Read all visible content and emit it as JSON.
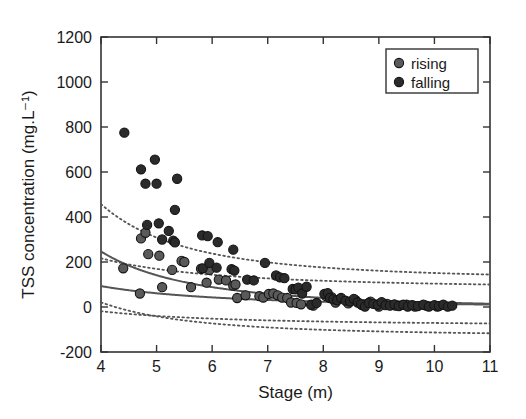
{
  "chart_data": {
    "type": "scatter",
    "title": "",
    "xlabel": "Stage (m)",
    "ylabel": "TSS concentration (mg.L⁻¹)",
    "xlim": [
      4,
      11
    ],
    "ylim": [
      -200,
      1200
    ],
    "xticks": [
      4,
      5,
      6,
      7,
      8,
      9,
      10,
      11
    ],
    "yticks": [
      -200,
      0,
      200,
      400,
      600,
      800,
      1000,
      1200
    ],
    "xticklabels": [
      "4",
      "5",
      "6",
      "7",
      "8",
      "9",
      "10",
      "11"
    ],
    "yticklabels": [
      "-200",
      "0",
      "200",
      "400",
      "600",
      "800",
      "1000",
      "1200"
    ],
    "grid": false,
    "legend": {
      "position": "top-right",
      "entries": [
        {
          "label": "rising",
          "marker": "circle",
          "color": "#5a5a5a"
        },
        {
          "label": "falling",
          "marker": "circle",
          "color": "#2b2b2b"
        }
      ]
    },
    "series": [
      {
        "name": "falling",
        "marker": "circle",
        "color": "#2b2b2b",
        "points": [
          [
            4.42,
            775
          ],
          [
            4.72,
            612
          ],
          [
            4.8,
            548
          ],
          [
            4.97,
            655
          ],
          [
            5.0,
            548
          ],
          [
            5.37,
            570
          ],
          [
            4.83,
            365
          ],
          [
            5.04,
            372
          ],
          [
            5.22,
            338
          ],
          [
            5.3,
            295
          ],
          [
            5.33,
            432
          ],
          [
            5.1,
            300
          ],
          [
            5.33,
            287
          ],
          [
            5.82,
            318
          ],
          [
            5.92,
            315
          ],
          [
            6.1,
            288
          ],
          [
            6.38,
            255
          ],
          [
            5.83,
            172
          ],
          [
            5.95,
            196
          ],
          [
            6.08,
            175
          ],
          [
            6.35,
            168
          ],
          [
            6.4,
            162
          ],
          [
            6.95,
            196
          ],
          [
            6.63,
            122
          ],
          [
            6.75,
            118
          ],
          [
            7.15,
            140
          ],
          [
            7.22,
            132
          ],
          [
            7.3,
            128
          ],
          [
            7.45,
            80
          ],
          [
            7.5,
            78
          ],
          [
            7.55,
            86
          ],
          [
            7.62,
            60
          ],
          [
            7.7,
            90
          ],
          [
            7.78,
            10
          ],
          [
            7.88,
            18
          ],
          [
            8.02,
            58
          ],
          [
            8.08,
            62
          ],
          [
            8.12,
            40
          ],
          [
            8.18,
            34
          ],
          [
            8.25,
            30
          ],
          [
            8.32,
            40
          ],
          [
            8.4,
            28
          ],
          [
            8.48,
            24
          ],
          [
            8.55,
            36
          ],
          [
            8.62,
            20
          ],
          [
            8.68,
            12
          ],
          [
            8.75,
            2
          ],
          [
            8.82,
            18
          ],
          [
            8.9,
            14
          ],
          [
            8.98,
            10
          ],
          [
            9.05,
            22
          ],
          [
            9.12,
            8
          ],
          [
            9.2,
            6
          ],
          [
            9.28,
            12
          ],
          [
            9.36,
            4
          ],
          [
            9.44,
            10
          ],
          [
            9.52,
            2
          ],
          [
            9.6,
            8
          ],
          [
            9.7,
            4
          ],
          [
            9.8,
            10
          ],
          [
            9.9,
            2
          ],
          [
            10.0,
            8
          ],
          [
            10.08,
            4
          ],
          [
            10.16,
            10
          ],
          [
            10.24,
            2
          ],
          [
            10.32,
            6
          ]
        ]
      },
      {
        "name": "rising",
        "marker": "circle",
        "color": "#5a5a5a",
        "points": [
          [
            4.4,
            172
          ],
          [
            4.7,
            60
          ],
          [
            4.72,
            305
          ],
          [
            4.8,
            330
          ],
          [
            4.85,
            235
          ],
          [
            5.05,
            228
          ],
          [
            5.1,
            88
          ],
          [
            5.28,
            165
          ],
          [
            5.45,
            205
          ],
          [
            5.5,
            200
          ],
          [
            5.62,
            88
          ],
          [
            5.8,
            170
          ],
          [
            5.9,
            108
          ],
          [
            5.95,
            165
          ],
          [
            6.12,
            122
          ],
          [
            6.25,
            118
          ],
          [
            6.38,
            95
          ],
          [
            6.42,
            100
          ],
          [
            6.45,
            40
          ],
          [
            6.6,
            52
          ],
          [
            6.85,
            48
          ],
          [
            6.92,
            42
          ],
          [
            7.02,
            58
          ],
          [
            7.1,
            60
          ],
          [
            7.18,
            52
          ],
          [
            7.26,
            42
          ],
          [
            7.35,
            40
          ],
          [
            7.42,
            20
          ],
          [
            7.52,
            18
          ],
          [
            7.6,
            12
          ],
          [
            7.82,
            6
          ],
          [
            8.05,
            48
          ],
          [
            8.15,
            44
          ],
          [
            8.22,
            20
          ],
          [
            8.45,
            16
          ],
          [
            8.58,
            30
          ],
          [
            8.7,
            8
          ],
          [
            8.85,
            24
          ],
          [
            9.0,
            2
          ],
          [
            9.15,
            14
          ],
          [
            9.3,
            6
          ],
          [
            9.5,
            10
          ],
          [
            9.65,
            2
          ],
          [
            9.85,
            6
          ],
          [
            10.05,
            2
          ]
        ]
      }
    ],
    "fit_curves": [
      {
        "name": "falling-fit",
        "style": "solid",
        "color": "#555555",
        "a": 7100,
        "b": 2.4,
        "c": -8
      },
      {
        "name": "rising-fit",
        "style": "solid",
        "color": "#555555",
        "a": 1120,
        "b": 1.75,
        "c": -6
      }
    ],
    "confidence_bands": [
      {
        "name": "falling-upper",
        "style": "dotted",
        "color": "#555555",
        "a": 12400,
        "b": 2.6,
        "c": 120
      },
      {
        "name": "falling-lower",
        "style": "dotted",
        "color": "#555555",
        "a": 4200,
        "b": 2.4,
        "c": -130
      },
      {
        "name": "rising-upper",
        "style": "dotted",
        "color": "#555555",
        "a": 1900,
        "b": 1.9,
        "c": 80
      },
      {
        "name": "rising-lower",
        "style": "dotted",
        "color": "#555555",
        "a": 700,
        "b": 1.7,
        "c": -85
      }
    ]
  }
}
